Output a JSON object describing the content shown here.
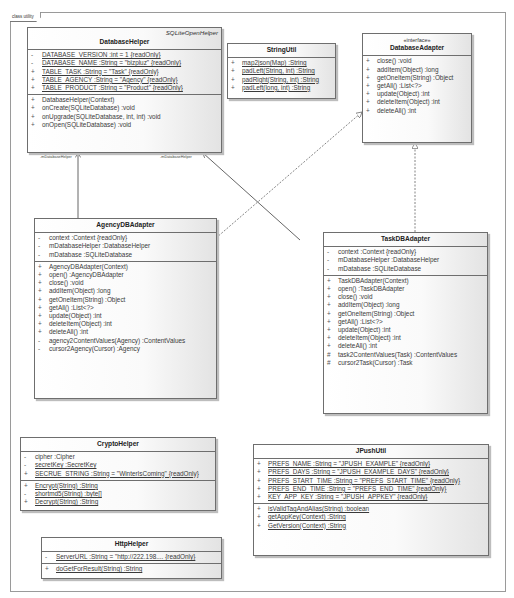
{
  "frame": {
    "label": "class utility"
  },
  "classes": {
    "database_helper": {
      "name": "DatabaseHelper",
      "superclass": "SQLiteOpenHelper",
      "attributes": [
        {
          "vis": "-",
          "text": "DATABASE_VERSION  :int = 1 {readOnly}",
          "static": true
        },
        {
          "vis": "-",
          "text": "DATABASE_NAME  :String = \"bizpluz\" {readOnly}",
          "static": true
        },
        {
          "vis": "+",
          "text": "TABLE_TASK  :String = \"Task\" {readOnly}",
          "static": true
        },
        {
          "vis": "+",
          "text": "TABLE_AGENCY  :String = \"Agency\" {readOnly}",
          "static": true
        },
        {
          "vis": "+",
          "text": "TABLE_PRODUCT  :String = \"Product\" {readOnly}",
          "static": true
        }
      ],
      "operations": [
        {
          "vis": "+",
          "text": "DatabaseHelper(Context)"
        },
        {
          "vis": "+",
          "text": "onCreate(SQLiteDatabase)  :void"
        },
        {
          "vis": "+",
          "text": "onUpgrade(SQLiteDatabase, int, int)  :void"
        },
        {
          "vis": "+",
          "text": "onOpen(SQLiteDatabase)  :void"
        }
      ]
    },
    "string_util": {
      "name": "StringUtil",
      "operations": [
        {
          "vis": "+",
          "text": "map2json(Map)  :String",
          "static": true
        },
        {
          "vis": "+",
          "text": "padLeft(String, int)  :String",
          "static": true
        },
        {
          "vis": "+",
          "text": "padRight(String, int)  :String",
          "static": true
        },
        {
          "vis": "+",
          "text": "padLeft(long, int)  :String",
          "static": true
        }
      ]
    },
    "database_adapter": {
      "stereotype": "«interface»",
      "name": "DatabaseAdapter",
      "operations": [
        {
          "vis": "+",
          "text": "close()  :void"
        },
        {
          "vis": "+",
          "text": "addItem(Object)  :long"
        },
        {
          "vis": "+",
          "text": "getOneItem(String)  :Object"
        },
        {
          "vis": "+",
          "text": "getAll()  :List<?>"
        },
        {
          "vis": "+",
          "text": "update(Object)  :int"
        },
        {
          "vis": "+",
          "text": "deleteItem(Object)  :int"
        },
        {
          "vis": "+",
          "text": "deleteAll()  :int"
        }
      ]
    },
    "agency_db_adapter": {
      "name": "AgencyDBAdapter",
      "attributes": [
        {
          "vis": "-",
          "text": "context  :Context {readOnly}"
        },
        {
          "vis": "-",
          "text": "mDatabaseHelper  :DatabaseHelper"
        },
        {
          "vis": "-",
          "text": "mDatabase  :SQLiteDatabase"
        }
      ],
      "operations": [
        {
          "vis": "+",
          "text": "AgencyDBAdapter(Context)"
        },
        {
          "vis": "+",
          "text": "open()  :AgencyDBAdapter"
        },
        {
          "vis": "+",
          "text": "close()  :void"
        },
        {
          "vis": "+",
          "text": "addItem(Object)  :long"
        },
        {
          "vis": "+",
          "text": "getOneItem(String)  :Object"
        },
        {
          "vis": "+",
          "text": "getAll()  :List<?>"
        },
        {
          "vis": "+",
          "text": "update(Object)  :int"
        },
        {
          "vis": "+",
          "text": "deleteItem(Object)  :int"
        },
        {
          "vis": "+",
          "text": "deleteAll()  :int"
        },
        {
          "vis": "-",
          "text": "agency2ContentValues(Agency)  :ContentValues"
        },
        {
          "vis": "-",
          "text": "cursor2Agency(Cursor)  :Agency"
        }
      ]
    },
    "task_db_adapter": {
      "name": "TaskDBAdapter",
      "attributes": [
        {
          "vis": "-",
          "text": "context  :Context {readOnly}"
        },
        {
          "vis": "-",
          "text": "mDatabaseHelper  :DatabaseHelper"
        },
        {
          "vis": "-",
          "text": "mDatabase  :SQLiteDatabase"
        }
      ],
      "operations": [
        {
          "vis": "+",
          "text": "TaskDBAdapter(Context)"
        },
        {
          "vis": "+",
          "text": "open()  :TaskDBAdapter"
        },
        {
          "vis": "+",
          "text": "close()  :void"
        },
        {
          "vis": "+",
          "text": "addItem(Object)  :long"
        },
        {
          "vis": "+",
          "text": "getOneItem(String)  :Object"
        },
        {
          "vis": "+",
          "text": "getAll()  :List<?>"
        },
        {
          "vis": "+",
          "text": "update(Object)  :int"
        },
        {
          "vis": "+",
          "text": "deleteItem(Object)  :int"
        },
        {
          "vis": "+",
          "text": "deleteAll()  :int"
        },
        {
          "vis": "#",
          "text": "task2ContentValues(Task)  :ContentValues"
        },
        {
          "vis": "#",
          "text": "cursor2Task(Cursor)  :Task"
        }
      ]
    },
    "crypto_helper": {
      "name": "CryptoHelper",
      "attributes": [
        {
          "vis": "-",
          "text": "cipher  :Cipher"
        },
        {
          "vis": "-",
          "text": "secretKey  :SecretKey",
          "static": true
        },
        {
          "vis": "+",
          "text": "SECRUE_STRING  :String = \"WinterIsComing\" {readOnly}",
          "static": true
        }
      ],
      "operations": [
        {
          "vis": "+",
          "text": "Encrypt(String)  :String",
          "static": true
        },
        {
          "vis": "-",
          "text": "shortmd5(String)  :byte[]",
          "static": true
        },
        {
          "vis": "+",
          "text": "Decrypt(String)  :String",
          "static": true
        }
      ]
    },
    "http_helper": {
      "name": "HttpHelper",
      "attributes": [
        {
          "vis": "-",
          "text": "ServerURL  :String = \"http://222.198....  {readOnly}",
          "static": true
        }
      ],
      "operations": [
        {
          "vis": "+",
          "text": "doGetForResult(String)  :String",
          "static": true
        }
      ]
    },
    "jpush_util": {
      "name": "JPushUtil",
      "attributes": [
        {
          "vis": "+",
          "text": "PREFS_NAME  :String = \"JPUSH_EXAMPLE\" {readOnly}",
          "static": true
        },
        {
          "vis": "+",
          "text": "PREFS_DAYS  :String = \"JPUSH_EXAMPLE_DAYS\" {readOnly}",
          "static": true
        },
        {
          "vis": "+",
          "text": "PREFS_START_TIME  :String = \"PREFS_START_TIME\" {readOnly}",
          "static": true
        },
        {
          "vis": "+",
          "text": "PREFS_END_TIME  :String = \"PREFS_END_TIME\" {readOnly}",
          "static": true
        },
        {
          "vis": "+",
          "text": "KEY_APP_KEY  :String = \"JPUSH_APPKEY\" {readOnly}",
          "static": true
        }
      ],
      "operations": [
        {
          "vis": "+",
          "text": "isValidTagAndAlias(String)  :boolean",
          "static": true
        },
        {
          "vis": "+",
          "text": "getAppKey(Context)  :String",
          "static": true
        },
        {
          "vis": "+",
          "text": "GetVersion(Context)  :String",
          "static": true
        }
      ]
    }
  },
  "relationships": [
    {
      "type": "association",
      "from": "AgencyDBAdapter",
      "to": "DatabaseHelper",
      "role": "-mDatabaseHelper"
    },
    {
      "type": "association",
      "from": "TaskDBAdapter",
      "to": "DatabaseHelper",
      "role": "-mDatabaseHelper"
    },
    {
      "type": "realization",
      "from": "AgencyDBAdapter",
      "to": "DatabaseAdapter"
    },
    {
      "type": "realization",
      "from": "TaskDBAdapter",
      "to": "DatabaseAdapter"
    }
  ]
}
